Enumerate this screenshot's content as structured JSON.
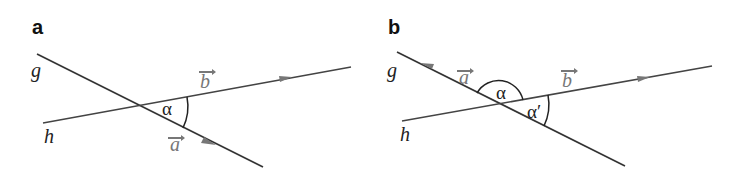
{
  "panels": [
    {
      "id": "a",
      "label": "a",
      "line_g": "g",
      "line_h": "h",
      "vector_a": "a",
      "vector_b": "b",
      "angle": "α"
    },
    {
      "id": "b",
      "label": "b",
      "line_g": "g",
      "line_h": "h",
      "vector_a": "a",
      "vector_b": "b",
      "angle": "α",
      "angle_prime": "α′"
    }
  ],
  "colors": {
    "line": "#333333",
    "vector_line": "#555555",
    "vector_label": "#777777",
    "arrow": "#777777"
  }
}
